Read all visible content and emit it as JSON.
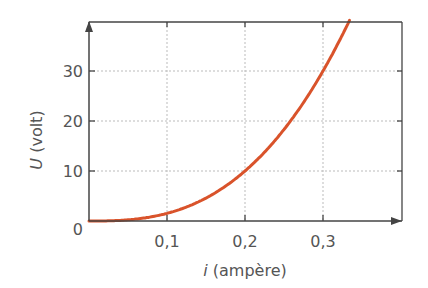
{
  "chart_data": {
    "type": "line",
    "title": "",
    "xlabel_var": "i",
    "xlabel_unit": " (ampère)",
    "ylabel_var": "U",
    "ylabel_unit": " (volt)",
    "xlim": [
      0,
      0.4
    ],
    "ylim": [
      0,
      40
    ],
    "x_ticks": [
      0.1,
      0.2,
      0.3
    ],
    "x_tick_labels": [
      "0,1",
      "0,2",
      "0,3"
    ],
    "y_ticks": [
      0,
      10,
      20,
      30
    ],
    "y_tick_labels": [
      "0",
      "10",
      "20",
      "30"
    ],
    "grid": true,
    "legend": null,
    "series": [
      {
        "name": "U(i)",
        "color": "#d9532b",
        "x": [
          0,
          0.05,
          0.1,
          0.15,
          0.2,
          0.25,
          0.263,
          0.3,
          0.33
        ],
        "y": [
          0,
          0.2,
          1.5,
          4.6,
          10,
          18.3,
          20,
          30,
          39
        ]
      }
    ]
  },
  "colors": {
    "axis": "#444444",
    "grid": "#bbbbbb",
    "curve": "#d9532b",
    "text": "#555555"
  }
}
